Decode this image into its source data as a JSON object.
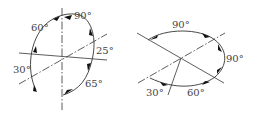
{
  "diagrams": [
    {
      "name": "left-rotation-diagram",
      "labels": [
        "60°",
        "90°",
        "25°",
        "30°",
        "65°"
      ]
    },
    {
      "name": "right-rotation-diagram",
      "labels": [
        "90°",
        "90°",
        "30°",
        "60°"
      ]
    }
  ]
}
